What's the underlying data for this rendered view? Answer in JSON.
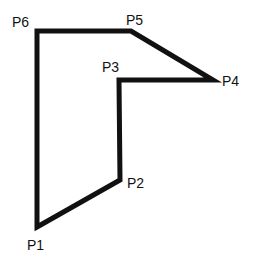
{
  "diagram": {
    "type": "polygon",
    "stroke_color": "#111111",
    "stroke_width": 5,
    "background": "#ffffff",
    "vertices": [
      {
        "name": "P1",
        "x": 37,
        "y": 227,
        "label": "P1",
        "label_x": 27,
        "label_y": 250
      },
      {
        "name": "P2",
        "x": 120,
        "y": 180,
        "label": "P2",
        "label_x": 127,
        "label_y": 188
      },
      {
        "name": "P3",
        "x": 119,
        "y": 80,
        "label": "P3",
        "label_x": 102,
        "label_y": 72
      },
      {
        "name": "P4",
        "x": 213,
        "y": 80,
        "label": "P4",
        "label_x": 222,
        "label_y": 86
      },
      {
        "name": "P5",
        "x": 131,
        "y": 31,
        "label": "P5",
        "label_x": 126,
        "label_y": 25
      },
      {
        "name": "P6",
        "x": 37,
        "y": 31,
        "label": "P6",
        "label_x": 12,
        "label_y": 27
      }
    ]
  }
}
